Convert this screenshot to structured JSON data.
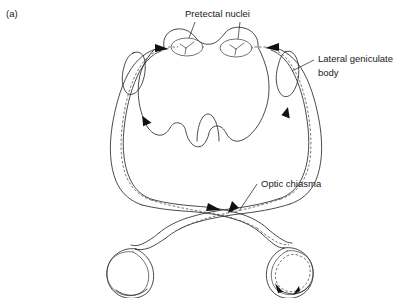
{
  "figure": {
    "panel_tag": "(a)",
    "type": "anatomical-diagram",
    "background_color": "#ffffff",
    "ink_color": "#2b2b2b",
    "labels": [
      {
        "id": "pretectal-nuclei",
        "text": "Pretectal nuclei",
        "x": 185,
        "y": 17,
        "anchor": "start",
        "lines": [
          "Pretectal nuclei"
        ]
      },
      {
        "id": "lateral-geniculate-body",
        "text": "Lateral geniculate body",
        "x": 318,
        "y": 62,
        "anchor": "start",
        "lines": [
          "Lateral geniculate",
          "body"
        ]
      },
      {
        "id": "optic-chiasma",
        "text": "Optic chiasma",
        "x": 261,
        "y": 187,
        "anchor": "start",
        "lines": [
          "Optic chiasma"
        ]
      }
    ],
    "structures": [
      {
        "id": "midbrain",
        "name": "midbrain"
      },
      {
        "id": "pretectal-nucleus-left",
        "name": "left pretectal nucleus"
      },
      {
        "id": "pretectal-nucleus-right",
        "name": "right pretectal nucleus"
      },
      {
        "id": "lateral-geniculate-left",
        "name": "left lateral geniculate body"
      },
      {
        "id": "lateral-geniculate-right",
        "name": "right lateral geniculate body"
      },
      {
        "id": "optic-tract-left",
        "name": "left optic tract"
      },
      {
        "id": "optic-tract-right",
        "name": "right optic tract"
      },
      {
        "id": "optic-chiasma",
        "name": "optic chiasma"
      },
      {
        "id": "optic-nerve-left",
        "name": "left optic nerve"
      },
      {
        "id": "optic-nerve-right",
        "name": "right optic nerve"
      },
      {
        "id": "eyeball-left",
        "name": "left eyeball"
      },
      {
        "id": "eyeball-right",
        "name": "right eyeball (stimulated)"
      }
    ]
  }
}
